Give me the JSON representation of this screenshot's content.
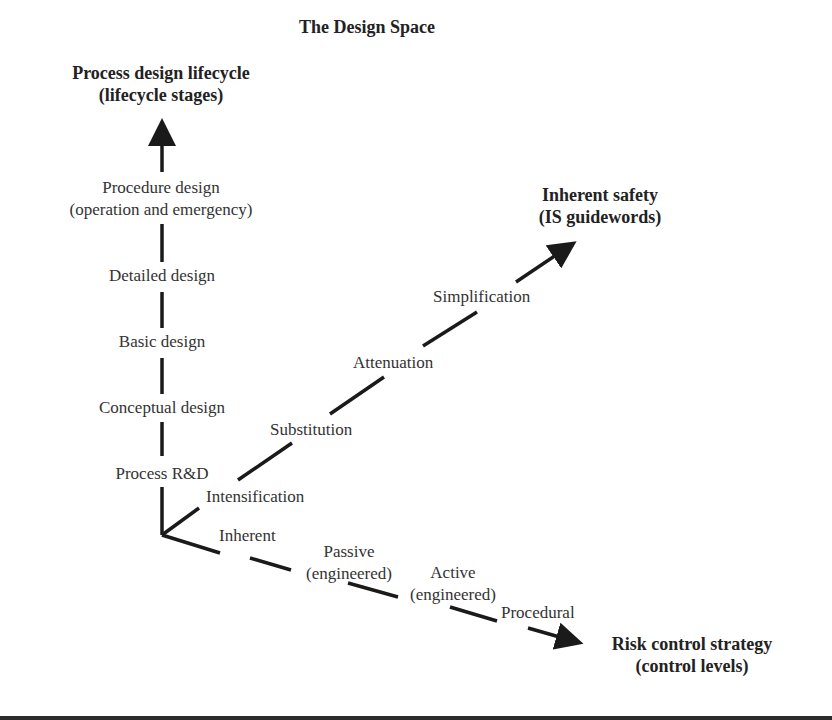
{
  "title": "The Design Space",
  "axes": {
    "vertical": {
      "title_line1": "Process design lifecycle",
      "title_line2": "(lifecycle stages)",
      "stages": [
        {
          "line1": "Procedure design",
          "line2": "(operation and emergency)"
        },
        {
          "line1": "Detailed design"
        },
        {
          "line1": "Basic design"
        },
        {
          "line1": "Conceptual design"
        },
        {
          "line1": "Process R&D"
        }
      ]
    },
    "diagonal": {
      "title_line1": "Inherent safety",
      "title_line2": "(IS guidewords)",
      "guidewords": [
        "Intensification",
        "Substitution",
        "Attenuation",
        "Simplification"
      ]
    },
    "horizontal": {
      "title_line1": "Risk control strategy",
      "title_line2": "(control levels)",
      "levels": [
        {
          "line1": "Inherent"
        },
        {
          "line1": "Passive",
          "line2": "(engineered)"
        },
        {
          "line1": "Active",
          "line2": "(engineered)"
        },
        {
          "line1": "Procedural"
        }
      ]
    }
  },
  "colors": {
    "line": "#1a1a1a",
    "text": "#333333",
    "bottom_band": "#2b2b2b"
  }
}
